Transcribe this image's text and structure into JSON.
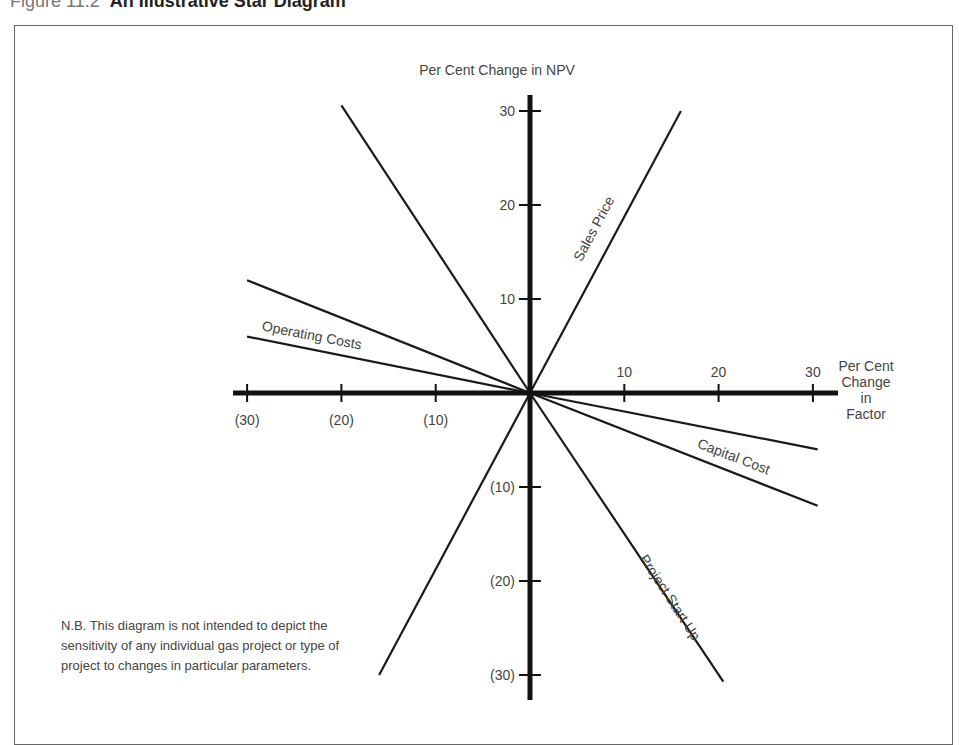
{
  "figure": {
    "number": "Figure 11.2",
    "title": "An Illustrative Star Diagram"
  },
  "note": "N.B. This diagram is not intended to depict the sensitivity of any individual gas project or type of project to changes in particular parameters.",
  "chart_data": {
    "type": "line",
    "title": "An Illustrative Star Diagram",
    "xlabel": "Per Cent Change in Factor",
    "xlabel_lines": [
      "Per Cent",
      "Change",
      "in",
      "Factor"
    ],
    "ylabel": "Per Cent Change in NPV",
    "xlim": [
      -32,
      32
    ],
    "ylim": [
      -32,
      32
    ],
    "grid": false,
    "x_ticks": [
      {
        "value": -30,
        "label": "(30)"
      },
      {
        "value": -20,
        "label": "(20)"
      },
      {
        "value": -10,
        "label": "(10)"
      },
      {
        "value": 10,
        "label": "10"
      },
      {
        "value": 20,
        "label": "20"
      },
      {
        "value": 30,
        "label": "30"
      }
    ],
    "y_ticks": [
      {
        "value": 30,
        "label": "30"
      },
      {
        "value": 20,
        "label": "20"
      },
      {
        "value": 10,
        "label": "10"
      },
      {
        "value": -10,
        "label": "(10)"
      },
      {
        "value": -20,
        "label": "(20)"
      },
      {
        "value": -30,
        "label": "(30)"
      }
    ],
    "series": [
      {
        "name": "Sales Price",
        "labeled": true,
        "points": [
          [
            0,
            0
          ],
          [
            16,
            30
          ]
        ]
      },
      {
        "name": "Sales Price (negative)",
        "labeled": false,
        "points": [
          [
            0,
            0
          ],
          [
            -16,
            -30
          ]
        ]
      },
      {
        "name": "Project Start Up",
        "labeled": true,
        "points": [
          [
            0,
            0
          ],
          [
            20.5,
            -30.7
          ]
        ]
      },
      {
        "name": "Project Start Up (negative)",
        "labeled": false,
        "points": [
          [
            0,
            0
          ],
          [
            -20,
            30.6
          ]
        ]
      },
      {
        "name": "Operating Costs",
        "labeled": true,
        "points": [
          [
            -30,
            6
          ],
          [
            0,
            0
          ]
        ]
      },
      {
        "name": "Operating Costs (extended)",
        "labeled": false,
        "points": [
          [
            -30,
            12
          ],
          [
            0,
            0
          ]
        ]
      },
      {
        "name": "Capital Cost",
        "labeled": true,
        "points": [
          [
            0,
            0
          ],
          [
            30.5,
            -12
          ]
        ]
      },
      {
        "name": "Capital Cost (reduced)",
        "labeled": false,
        "points": [
          [
            0,
            0
          ],
          [
            30.5,
            -6
          ]
        ]
      }
    ]
  }
}
